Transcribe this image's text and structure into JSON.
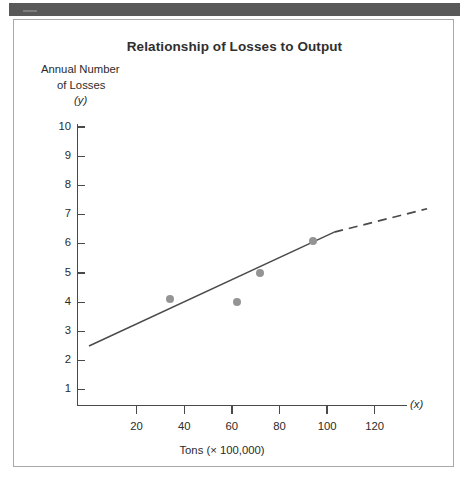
{
  "figure": {
    "title": "Relationship of Losses to Output",
    "y_caption": {
      "line1": "Annual Number",
      "line2": "of Losses",
      "line3": "(y)"
    },
    "x_axis_name": "(x)",
    "x_caption": "Tons (× 100,000)"
  },
  "chart_data": {
    "type": "scatter",
    "title": "Relationship of Losses to Output",
    "xlabel": "Tons (× 100,000)",
    "ylabel": "Annual Number of Losses (y)",
    "x_axis_symbol": "(x)",
    "y_axis_symbol": "(y)",
    "xlim": [
      0,
      133
    ],
    "ylim": [
      0,
      10.6
    ],
    "grid": false,
    "legend": "none",
    "x_ticks": [
      20,
      40,
      60,
      80,
      100,
      120
    ],
    "y_ticks": [
      1,
      2,
      3,
      4,
      5,
      6,
      7,
      8,
      9,
      10
    ],
    "x_tick_labels": [
      "20",
      "40",
      "60",
      "80",
      "100",
      "120"
    ],
    "y_tick_labels": [
      "1",
      "2",
      "3",
      "4",
      "5",
      "6",
      "7",
      "8",
      "9",
      "10"
    ],
    "points": [
      {
        "x": 34,
        "y": 4.1
      },
      {
        "x": 62,
        "y": 4.0
      },
      {
        "x": 72,
        "y": 5.0
      },
      {
        "x": 94,
        "y": 6.1
      }
    ],
    "series": [
      {
        "name": "observations",
        "type": "scatter",
        "marker": "filled-circle",
        "color": "#949494",
        "x": [
          34,
          62,
          72,
          94
        ],
        "values": [
          4.1,
          4.0,
          5.0,
          6.1
        ]
      },
      {
        "name": "regression line (fitted)",
        "type": "line",
        "style": "solid",
        "color": "#4a4a4a",
        "x": [
          0,
          103
        ],
        "values": [
          2.5,
          6.4
        ]
      },
      {
        "name": "regression line (extrapolated)",
        "type": "line",
        "style": "dashed",
        "color": "#4a4a4a",
        "x": [
          103,
          142
        ],
        "values": [
          6.4,
          7.2
        ]
      }
    ],
    "annotations": [
      "Solid trend line begins at approximately y = 2.5 on the y-axis",
      "Dashed segment extrapolates the trend beyond the data"
    ]
  }
}
